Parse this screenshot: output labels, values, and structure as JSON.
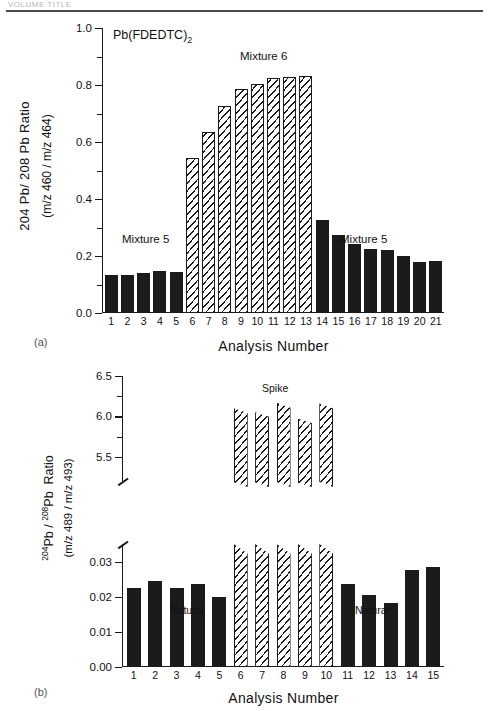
{
  "running_head": "VOLUME TITLE",
  "panel_a": {
    "tag": "(a)",
    "chem_title": "Pb(FDEDTC)",
    "chem_sub": "2",
    "y_axis_line1": "204 Pb/ 208 Pb  Ratio",
    "y_axis_line2": "(m/z 460 / m/z 464)",
    "x_axis_title": "Analysis Number",
    "ann_mix5_left": "Mixture 5",
    "ann_mix6": "Mixture 6",
    "ann_mix5_right": "Mixture 5",
    "y_ticks": [
      "0.0",
      "0.2",
      "0.4",
      "0.6",
      "0.8",
      "1.0"
    ],
    "x_labels": [
      "1",
      "2",
      "3",
      "4",
      "5",
      "6",
      "7",
      "8",
      "9",
      "10",
      "11",
      "12",
      "13",
      "14",
      "15",
      "16",
      "17",
      "18",
      "19",
      "20",
      "21"
    ]
  },
  "panel_b": {
    "tag": "(b)",
    "y_axis_line1": "204Pb / 208Pb  Ratio",
    "y_axis_line2": "(m/z 489 / m/z 493)",
    "x_axis_title": "Analysis Number",
    "ann_spike": "Spike",
    "ann_natural_left": "Natural",
    "ann_natural_right": "Natural",
    "y_ticks_upper": [
      "5.5",
      "6.0",
      "6.5"
    ],
    "y_ticks_lower": [
      "0.00",
      "0.01",
      "0.02",
      "0.03"
    ],
    "x_labels": [
      "1",
      "2",
      "3",
      "4",
      "5",
      "6",
      "7",
      "8",
      "9",
      "10",
      "11",
      "12",
      "13",
      "14",
      "15"
    ]
  },
  "chart_data": [
    {
      "type": "bar",
      "panel": "(a)",
      "title": "Pb(FDEDTC)2",
      "xlabel": "Analysis Number",
      "ylabel": "204 Pb/ 208 Pb Ratio (m/z 460 / m/z 464)",
      "ylim": [
        0.0,
        1.0
      ],
      "ytick_values": [
        0.0,
        0.2,
        0.4,
        0.6,
        0.8,
        1.0
      ],
      "grid": false,
      "legend": "none",
      "categories": [
        "1",
        "2",
        "3",
        "4",
        "5",
        "6",
        "7",
        "8",
        "9",
        "10",
        "11",
        "12",
        "13",
        "14",
        "15",
        "16",
        "17",
        "18",
        "19",
        "20",
        "21"
      ],
      "values": [
        0.132,
        0.133,
        0.139,
        0.146,
        0.143,
        0.543,
        0.634,
        0.725,
        0.787,
        0.805,
        0.823,
        0.828,
        0.832,
        0.325,
        0.272,
        0.243,
        0.226,
        0.22,
        0.2,
        0.18,
        0.182
      ],
      "fills": [
        "solid",
        "solid",
        "solid",
        "solid",
        "solid",
        "hatch",
        "hatch",
        "hatch",
        "hatch",
        "hatch",
        "hatch",
        "hatch",
        "hatch",
        "solid",
        "solid",
        "solid",
        "solid",
        "solid",
        "solid",
        "solid",
        "solid"
      ],
      "annotations": [
        {
          "text": "Mixture 5",
          "near_categories": [
            "1",
            "5"
          ]
        },
        {
          "text": "Mixture 6",
          "near_categories": [
            "9",
            "11"
          ]
        },
        {
          "text": "Mixture 5",
          "near_categories": [
            "17",
            "19"
          ]
        }
      ]
    },
    {
      "type": "bar",
      "panel": "(b)",
      "xlabel": "Analysis Number",
      "ylabel": "204Pb / 208Pb Ratio (m/z 489 / m/z 493)",
      "broken_axis": true,
      "ylim_lower": [
        0.0,
        0.035
      ],
      "ytick_values_lower": [
        0.0,
        0.01,
        0.02,
        0.03
      ],
      "ylim_upper": [
        5.2,
        6.5
      ],
      "ytick_values_upper": [
        5.5,
        6.0,
        6.5
      ],
      "grid": false,
      "legend": "none",
      "categories": [
        "1",
        "2",
        "3",
        "4",
        "5",
        "6",
        "7",
        "8",
        "9",
        "10",
        "11",
        "12",
        "13",
        "14",
        "15"
      ],
      "values": [
        0.0225,
        0.0245,
        0.0225,
        0.0236,
        0.0199,
        6.1,
        6.05,
        6.17,
        5.97,
        6.16,
        0.0236,
        0.0205,
        0.0183,
        0.0275,
        0.0285
      ],
      "fills": [
        "solid",
        "solid",
        "solid",
        "solid",
        "solid",
        "hatch",
        "hatch",
        "hatch",
        "hatch",
        "hatch",
        "solid",
        "solid",
        "solid",
        "solid",
        "solid"
      ],
      "annotations": [
        {
          "text": "Natural",
          "near_categories": [
            "2",
            "4"
          ]
        },
        {
          "text": "Spike",
          "near_categories": [
            "7",
            "8"
          ]
        },
        {
          "text": "Natural",
          "near_categories": [
            "12",
            "14"
          ]
        }
      ]
    }
  ]
}
